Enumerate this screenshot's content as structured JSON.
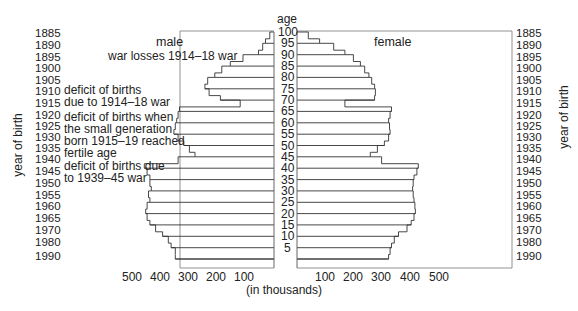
{
  "chart_data": {
    "type": "bar",
    "subtype": "population-pyramid",
    "title": "",
    "center_axis_label": "age",
    "xlabel": "(in thousands)",
    "ylabel_left": "year of birth",
    "ylabel_right": "year of birth",
    "xlim": [
      0,
      500
    ],
    "x_ticks": [
      100,
      200,
      300,
      400,
      500
    ],
    "age_ticks": [
      100,
      95,
      90,
      85,
      80,
      75,
      70,
      65,
      60,
      55,
      50,
      45,
      40,
      35,
      30,
      25,
      20,
      15,
      10,
      5
    ],
    "year_of_birth_ticks": [
      "1885",
      "1890",
      "1895",
      "1900",
      "1905",
      "1910",
      "1915",
      "1920",
      "1925",
      "1930",
      "1935",
      "1940",
      "1945",
      "1950",
      "1955",
      "1960",
      "1965",
      "1970",
      "1980",
      "1990"
    ],
    "panel_labels": {
      "male": "male",
      "female": "female"
    },
    "ages": [
      0,
      2,
      5,
      7,
      10,
      12,
      15,
      17,
      20,
      22,
      25,
      27,
      30,
      32,
      35,
      37,
      40,
      42,
      45,
      47,
      50,
      52,
      55,
      57,
      60,
      62,
      65,
      67,
      70,
      72,
      75,
      77,
      80,
      82,
      85,
      87,
      90,
      92,
      95,
      97,
      100
    ],
    "series": [
      {
        "name": "male",
        "values": [
          350,
          350,
          365,
          375,
          395,
          420,
          440,
          450,
          455,
          450,
          440,
          445,
          435,
          440,
          440,
          450,
          460,
          340,
          280,
          300,
          320,
          340,
          355,
          350,
          345,
          340,
          335,
          120,
          190,
          230,
          245,
          235,
          210,
          185,
          155,
          110,
          55,
          40,
          30,
          15,
          5
        ]
      },
      {
        "name": "female",
        "values": [
          325,
          330,
          335,
          345,
          360,
          390,
          405,
          415,
          420,
          418,
          415,
          412,
          410,
          412,
          415,
          425,
          430,
          300,
          260,
          285,
          310,
          325,
          330,
          328,
          325,
          330,
          335,
          170,
          275,
          278,
          275,
          265,
          255,
          240,
          225,
          200,
          170,
          130,
          80,
          40,
          10
        ]
      }
    ],
    "annotations": [
      "war losses 1914–18 war",
      "deficit of births due to 1914–18 war",
      "deficit of births when the small generation born 1915–19 reached fertile age",
      "deficit of births due to 1939–45 war"
    ],
    "grid": false,
    "legend": "none"
  },
  "labels": {
    "age": "age",
    "male": "male",
    "female": "female",
    "in_thousands": "(in thousands)",
    "year_of_birth": "year of birth",
    "annot1": "war losses 1914–18 war",
    "annot2a": "deficit of births",
    "annot2b": "due to 1914–18 war",
    "annot3a": "deficit of births when",
    "annot3b": "the small generation",
    "annot3c": "born 1915–19 reached",
    "annot3d": "fertile age",
    "annot4a": "deficit of births due",
    "annot4b": "to 1939–45 war"
  },
  "male_ticks": [
    "500",
    "400",
    "300",
    "200",
    "100"
  ],
  "female_ticks": [
    "100",
    "200",
    "300",
    "400",
    "500"
  ],
  "age_labels": [
    "100",
    "95",
    "90",
    "85",
    "80",
    "75",
    "70",
    "65",
    "60",
    "55",
    "50",
    "45",
    "40",
    "35",
    "30",
    "25",
    "20",
    "15",
    "10",
    "5"
  ],
  "year_labels": [
    "1885",
    "1890",
    "1895",
    "1900",
    "1905",
    "1910",
    "1915",
    "1920",
    "1925",
    "1930",
    "1935",
    "1940",
    "1945",
    "1950",
    "1955",
    "1960",
    "1965",
    "1970",
    "1980",
    "1990"
  ]
}
